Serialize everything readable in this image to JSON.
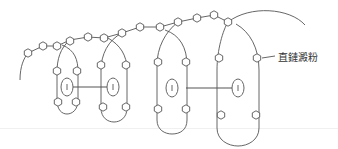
{
  "diagram": {
    "label": "直鏈澱粉",
    "inner_unit_glyph": "I",
    "colors": {
      "stroke": "#555555",
      "background": "#ffffff",
      "text": "#333333"
    },
    "helix_loops": [
      {
        "id": 1,
        "cx": 67,
        "top": 46,
        "bottom": 112,
        "rx": 11
      },
      {
        "id": 2,
        "cx": 113,
        "top": 36,
        "bottom": 120,
        "rx": 13
      },
      {
        "id": 3,
        "cx": 172,
        "top": 30,
        "bottom": 131,
        "rx": 16
      },
      {
        "id": 4,
        "cx": 238,
        "top": 24,
        "bottom": 144,
        "rx": 21
      }
    ],
    "connectors": [
      {
        "from_loop": 1,
        "to_loop": 2
      },
      {
        "from_loop": 3,
        "to_loop": 4
      }
    ]
  }
}
